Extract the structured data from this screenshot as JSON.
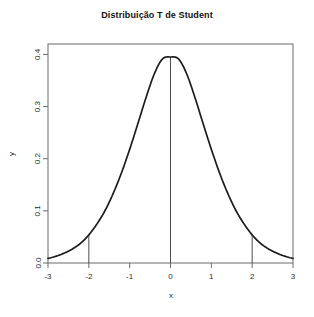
{
  "chart_data": {
    "type": "line",
    "title": "Distribuição T de Student",
    "xlabel": "x",
    "ylabel": "y",
    "xlim": [
      -3,
      3
    ],
    "ylim": [
      0,
      0.42
    ],
    "grid": false,
    "legend": null,
    "xticks": [
      "-3",
      "-2",
      "-1",
      "0",
      "1",
      "2",
      "3"
    ],
    "xtick_values": [
      -3,
      -2,
      -1,
      0,
      1,
      2,
      3
    ],
    "yticks": [
      "0.0",
      "0.1",
      "0.2",
      "0.3",
      "0.4"
    ],
    "ytick_values": [
      0.0,
      0.1,
      0.2,
      0.3,
      0.4
    ],
    "series": [
      {
        "name": "t density",
        "x": [
          -3,
          -2.8,
          -2.6,
          -2.4,
          -2.2,
          -2,
          -1.8,
          -1.6,
          -1.4,
          -1.2,
          -1,
          -0.8,
          -0.6,
          -0.4,
          -0.2,
          0,
          0.2,
          0.4,
          0.6,
          0.8,
          1,
          1.2,
          1.4,
          1.6,
          1.8,
          2,
          2.2,
          2.4,
          2.6,
          2.8,
          3
        ],
        "values": [
          0.009,
          0.013,
          0.019,
          0.027,
          0.038,
          0.054,
          0.075,
          0.101,
          0.134,
          0.173,
          0.218,
          0.267,
          0.317,
          0.362,
          0.391,
          0.395,
          0.391,
          0.362,
          0.317,
          0.267,
          0.218,
          0.173,
          0.134,
          0.101,
          0.075,
          0.054,
          0.038,
          0.027,
          0.019,
          0.013,
          0.009
        ]
      }
    ],
    "vertical_lines": [
      {
        "x": -2,
        "y_top": 0.054
      },
      {
        "x": 0,
        "y_top": 0.395
      },
      {
        "x": 2,
        "y_top": 0.054
      }
    ],
    "peak_value": 0.395,
    "colors": {
      "curve": "#1c1c1c",
      "vline": "#3a3a3a",
      "axis": "#6b6b6b",
      "text": "#2b2b2b"
    }
  }
}
